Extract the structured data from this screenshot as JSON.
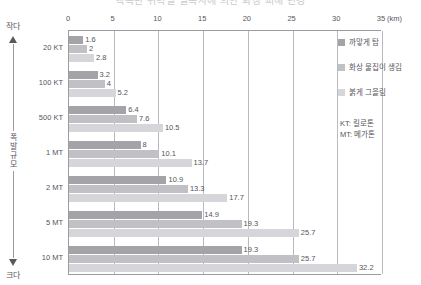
{
  "title_partial": "핵폭탄 위력별 열복사에 의한 화상 피해 반경",
  "vertical_axis": {
    "top_label": "작다",
    "mid_label": "폭발규모",
    "bottom_label": "크다",
    "arrow_up_icon": "arrow-up-icon",
    "arrow_down_icon": "arrow-down-icon"
  },
  "legend": {
    "position": "right",
    "items": [
      {
        "label": "까맣게 탐",
        "color": "#a3a3a8"
      },
      {
        "label": "화상 물집이 생김",
        "color": "#c0c0c5"
      },
      {
        "label": "붉게 그을림",
        "color": "#d6d6da"
      }
    ]
  },
  "abbreviations": {
    "line1": "KT: 킬로톤",
    "line2": "MT: 메가톤"
  },
  "chart_data": {
    "type": "bar",
    "orientation": "horizontal",
    "title": "핵폭탄 위력별 열복사에 의한 화상 피해 반경",
    "xlabel": "(km)",
    "ylabel": "폭발규모",
    "xlim": [
      0,
      35
    ],
    "xticks": [
      0,
      5,
      10,
      15,
      20,
      25,
      30,
      35
    ],
    "xtick_labels": [
      "0",
      "5",
      "10",
      "15",
      "20",
      "25",
      "30",
      "35"
    ],
    "x_unit": "(km)",
    "grid": true,
    "legend_position": "right",
    "categories": [
      "20 KT",
      "100 KT",
      "500 KT",
      "1 MT",
      "2 MT",
      "5 MT",
      "10 MT"
    ],
    "series": [
      {
        "name": "까맣게 탐",
        "color": "#a3a3a8",
        "values": [
          1.6,
          3.2,
          6.4,
          8,
          10.9,
          14.9,
          19.3
        ],
        "labels": [
          "1.6",
          "3.2",
          "6.4",
          "8",
          "10.9",
          "14.9",
          "19.3"
        ]
      },
      {
        "name": "화상 물집이 생김",
        "color": "#c0c0c5",
        "values": [
          2,
          4,
          7.6,
          10.1,
          13.3,
          19.3,
          25.7
        ],
        "labels": [
          "2",
          "4",
          "7.6",
          "10.1",
          "13.3",
          "19.3",
          "25.7"
        ]
      },
      {
        "name": "붉게 그을림",
        "color": "#d6d6da",
        "values": [
          2.8,
          5.2,
          10.5,
          13.7,
          17.7,
          25.7,
          32.2
        ],
        "labels": [
          "2.8",
          "5.2",
          "10.5",
          "13.7",
          "17.7",
          "25.7",
          "32.2"
        ]
      }
    ]
  }
}
